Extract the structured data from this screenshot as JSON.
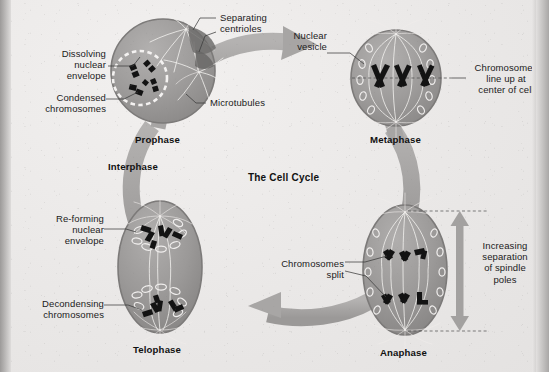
{
  "figure": {
    "title": "The Cell Cycle",
    "type": "cell-cycle-diagram"
  },
  "phases": [
    {
      "key": "prophase",
      "label": "Prophase",
      "shape": "circle"
    },
    {
      "key": "metaphase",
      "label": "Metaphase",
      "shape": "circle"
    },
    {
      "key": "anaphase",
      "label": "Anaphase",
      "shape": "ellipse"
    },
    {
      "key": "telophase",
      "label": "Telophase",
      "shape": "ellipse"
    }
  ],
  "interphase_label": "Interphase",
  "callouts": {
    "dissolving_nuclear_envelope": "Dissolving\nnuclear\nenvelope",
    "condensed_chromosomes": "Condensed\nchromosomes",
    "separating_centrioles": "Separating\ncentrioles",
    "microtubules": "Microtubules",
    "nuclear_vesicle": "Nuclear\nvesicle",
    "chromosomes_line_up": "Chromosomes\nline up at\ncenter of cell",
    "increasing_separation": "Increasing\nseparation\nof spindle\npoles",
    "chromosomes_split": "Chromosomes\nsplit",
    "reforming_nuclear_envelope": "Re-forming\nnuclear\nenvelope",
    "decondensing_chromosomes": "Decondensing\nchromosomes"
  },
  "colors": {
    "background": "#eceaea",
    "cycle_arrow": "#a9a7a6",
    "cell_fill": "#9d9b9a",
    "cell_rim": "#7e7c7b",
    "chromosome": "#141414",
    "spindle": "#f2f0ee",
    "text": "#1b1b1b",
    "leader_line": "#3a3a3a",
    "edge_band": "#9c9a99"
  }
}
